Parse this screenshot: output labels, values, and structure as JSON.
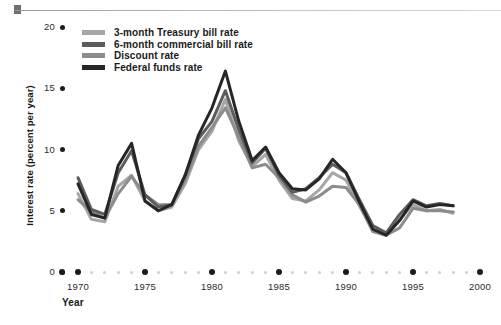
{
  "chart_data": {
    "type": "line",
    "title": "",
    "xlabel": "Year",
    "ylabel": "Interest rate (percent per year)",
    "xlim": [
      1969,
      2000
    ],
    "ylim": [
      0,
      20
    ],
    "grid": false,
    "legend_position": "top-left",
    "ytick_labels": [
      "0",
      "5",
      "10",
      "15",
      "20"
    ],
    "ytick_values": [
      0,
      5,
      10,
      15,
      20
    ],
    "xtick_labels": [
      "1970",
      "1975",
      "1980",
      "1985",
      "1990",
      "1995",
      "2000"
    ],
    "xtick_values": [
      1970,
      1975,
      1980,
      1985,
      1990,
      1995,
      2000
    ],
    "x": [
      1970,
      1971,
      1972,
      1973,
      1974,
      1975,
      1976,
      1977,
      1978,
      1979,
      1980,
      1981,
      1982,
      1983,
      1984,
      1985,
      1986,
      1987,
      1988,
      1989,
      1990,
      1991,
      1992,
      1993,
      1994,
      1995,
      1996,
      1997,
      1998
    ],
    "series": [
      {
        "name": "3-month Treasury bill rate",
        "color": "#a6a6a6",
        "values": [
          6.4,
          4.3,
          4.1,
          7.0,
          7.9,
          5.8,
          5.0,
          5.3,
          7.2,
          10.0,
          11.5,
          14.1,
          10.7,
          8.6,
          9.6,
          7.5,
          6.0,
          5.8,
          6.7,
          8.1,
          7.5,
          5.4,
          3.4,
          3.0,
          4.3,
          5.5,
          5.0,
          5.1,
          4.8
        ]
      },
      {
        "name": "6-month commercial bill rate",
        "color": "#5c5c5c",
        "values": [
          7.7,
          5.1,
          4.7,
          8.1,
          9.9,
          6.3,
          5.3,
          5.5,
          7.9,
          10.9,
          12.3,
          14.8,
          11.6,
          8.9,
          10.1,
          7.9,
          6.5,
          6.8,
          7.7,
          8.8,
          8.1,
          5.9,
          3.8,
          3.2,
          4.7,
          5.9,
          5.4,
          5.6,
          5.4
        ]
      },
      {
        "name": "Discount rate",
        "color": "#8c8c8c",
        "values": [
          5.9,
          4.9,
          4.4,
          6.4,
          7.8,
          6.3,
          5.5,
          5.5,
          7.5,
          10.3,
          11.8,
          13.4,
          11.0,
          8.5,
          8.8,
          7.7,
          6.3,
          5.7,
          6.2,
          7.0,
          6.9,
          5.5,
          3.3,
          3.0,
          3.6,
          5.2,
          5.0,
          5.0,
          4.9
        ]
      },
      {
        "name": "Federal funds rate",
        "color": "#262626",
        "values": [
          7.2,
          4.7,
          4.4,
          8.7,
          10.5,
          5.8,
          5.0,
          5.5,
          7.9,
          11.2,
          13.4,
          16.4,
          12.3,
          9.1,
          10.2,
          8.1,
          6.8,
          6.7,
          7.6,
          9.2,
          8.1,
          5.7,
          3.5,
          3.0,
          4.2,
          5.8,
          5.3,
          5.5,
          5.4
        ]
      }
    ]
  },
  "legend": {
    "items": [
      {
        "label": "3-month Treasury bill rate",
        "color": "#a6a6a6"
      },
      {
        "label": "6-month commercial bill rate",
        "color": "#5c5c5c"
      },
      {
        "label": "Discount rate",
        "color": "#8c8c8c"
      },
      {
        "label": "Federal funds rate",
        "color": "#262626"
      }
    ]
  },
  "axes": {
    "y_title": "Interest rate (percent per year)",
    "x_title": "Year"
  }
}
